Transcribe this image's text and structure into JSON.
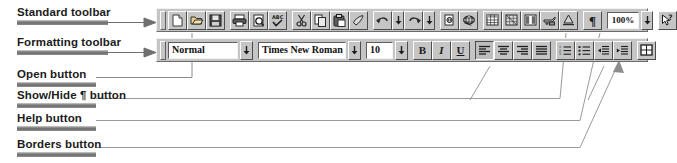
{
  "figure": {
    "label_color": "#1b1b1b",
    "bar_color": "#6d6d6d",
    "leader_color": "#8c8c8c",
    "toolbar_face": "#c5c5c5"
  },
  "callouts": [
    {
      "id": "standard-toolbar-callout",
      "label": "Standard toolbar"
    },
    {
      "id": "formatting-toolbar-callout",
      "label": "Formatting toolbar"
    },
    {
      "id": "open-button-callout",
      "label": "Open button"
    },
    {
      "id": "show-hide-button-callout",
      "label": "Show/Hide ¶ button"
    },
    {
      "id": "help-button-callout",
      "label": "Help button"
    },
    {
      "id": "borders-button-callout",
      "label": "Borders button"
    }
  ],
  "standard_toolbar": {
    "name": "Standard toolbar",
    "buttons": [
      {
        "name": "new-document-button",
        "tip": "New"
      },
      {
        "name": "open-button",
        "tip": "Open"
      },
      {
        "name": "save-button",
        "tip": "Save"
      },
      {
        "name": "print-button",
        "tip": "Print"
      },
      {
        "name": "print-preview-button",
        "tip": "Print Preview"
      },
      {
        "name": "spelling-button",
        "tip": "Spelling"
      },
      {
        "name": "cut-button",
        "tip": "Cut"
      },
      {
        "name": "copy-button",
        "tip": "Copy"
      },
      {
        "name": "paste-button",
        "tip": "Paste"
      },
      {
        "name": "format-painter-button",
        "tip": "Format Painter"
      },
      {
        "name": "undo-button",
        "tip": "Undo"
      },
      {
        "name": "undo-dropdown",
        "tip": "Undo history"
      },
      {
        "name": "redo-button",
        "tip": "Redo"
      },
      {
        "name": "redo-dropdown",
        "tip": "Redo history"
      },
      {
        "name": "insert-hyperlink-button",
        "tip": "Insert Hyperlink"
      },
      {
        "name": "web-toolbar-button",
        "tip": "Web Toolbar"
      },
      {
        "name": "insert-table-button",
        "tip": "Insert Table"
      },
      {
        "name": "insert-excel-worksheet-button",
        "tip": "Insert Microsoft Excel Worksheet"
      },
      {
        "name": "columns-button",
        "tip": "Columns"
      },
      {
        "name": "drawing-button",
        "tip": "Drawing"
      },
      {
        "name": "document-map-button",
        "tip": "Document Map"
      },
      {
        "name": "show-hide-paragraph-button",
        "tip": "Show/Hide ¶",
        "glyph": "¶"
      },
      {
        "name": "zoom-box",
        "tip": "Zoom",
        "value": "100%"
      },
      {
        "name": "zoom-dropdown",
        "tip": "Zoom list"
      },
      {
        "name": "help-button",
        "tip": "Help"
      }
    ]
  },
  "formatting_toolbar": {
    "name": "Formatting toolbar",
    "style_combo": {
      "name": "style-combo",
      "value": "Normal"
    },
    "font_combo": {
      "name": "font-combo",
      "value": "Times New Roman"
    },
    "size_combo": {
      "name": "size-combo",
      "value": "10"
    },
    "buttons": [
      {
        "name": "bold-button",
        "glyph": "B"
      },
      {
        "name": "italic-button",
        "glyph": "I"
      },
      {
        "name": "underline-button",
        "glyph": "U"
      },
      {
        "name": "align-left-button",
        "tip": "Align Left",
        "pressed": true
      },
      {
        "name": "align-center-button",
        "tip": "Center"
      },
      {
        "name": "align-right-button",
        "tip": "Align Right"
      },
      {
        "name": "justify-button",
        "tip": "Justify"
      },
      {
        "name": "numbering-button",
        "tip": "Numbering"
      },
      {
        "name": "bullets-button",
        "tip": "Bullets"
      },
      {
        "name": "decrease-indent-button",
        "tip": "Decrease Indent"
      },
      {
        "name": "increase-indent-button",
        "tip": "Increase Indent"
      },
      {
        "name": "borders-button",
        "tip": "Borders"
      }
    ]
  }
}
